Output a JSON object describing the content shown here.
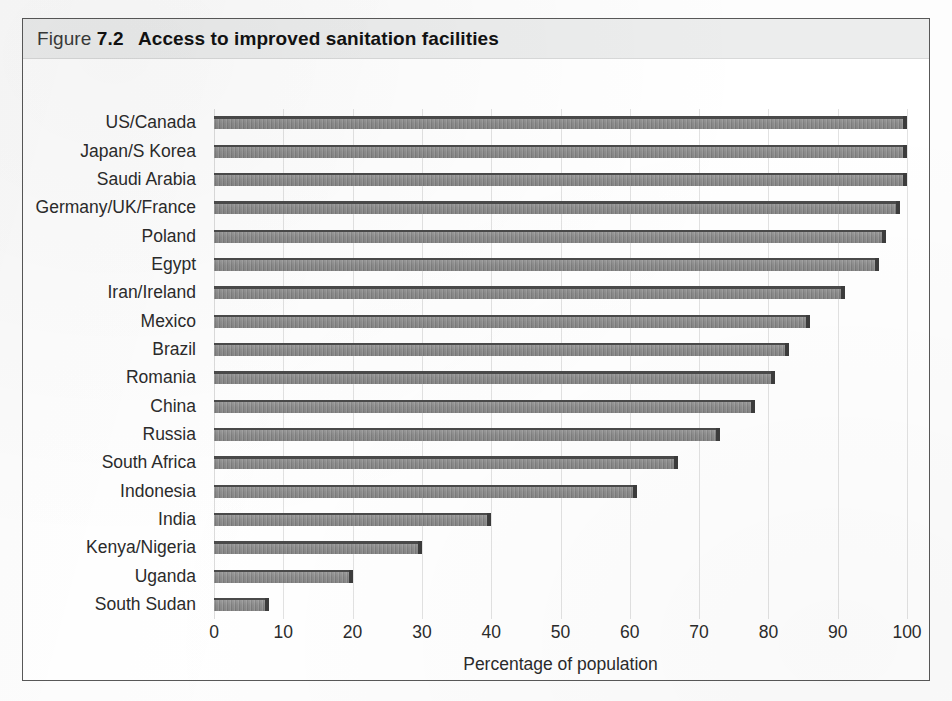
{
  "figure": {
    "label_word": "Figure",
    "number": "7.2",
    "title": "Access to improved sanitation facilities"
  },
  "colors": {
    "bar_fill": "#8a8a8a",
    "bar_edge": "#3c3c3c",
    "caption_band": "#eceded",
    "frame": "#585858",
    "gridline": "#e2e2e2",
    "text": "#2b2b2b"
  },
  "chart_data": {
    "type": "bar",
    "orientation": "horizontal",
    "title": "Access to improved sanitation facilities",
    "xlabel": "Percentage of population",
    "ylabel": "",
    "xlim": [
      0,
      100
    ],
    "xticks": [
      0,
      10,
      20,
      30,
      40,
      50,
      60,
      70,
      80,
      90,
      100
    ],
    "xticklabels": [
      "0",
      "10",
      "20",
      "30",
      "40",
      "50",
      "60",
      "70",
      "80",
      "90",
      "100"
    ],
    "grid": "vertical",
    "legend": "none",
    "categories": [
      "US/Canada",
      "Japan/S Korea",
      "Saudi Arabia",
      "Germany/UK/France",
      "Poland",
      "Egypt",
      "Iran/Ireland",
      "Mexico",
      "Brazil",
      "Romania",
      "China",
      "Russia",
      "South Africa",
      "Indonesia",
      "India",
      "Kenya/Nigeria",
      "Uganda",
      "South Sudan"
    ],
    "values": [
      100,
      100,
      100,
      99,
      97,
      96,
      91,
      86,
      83,
      81,
      78,
      73,
      67,
      61,
      40,
      30,
      20,
      8
    ]
  }
}
